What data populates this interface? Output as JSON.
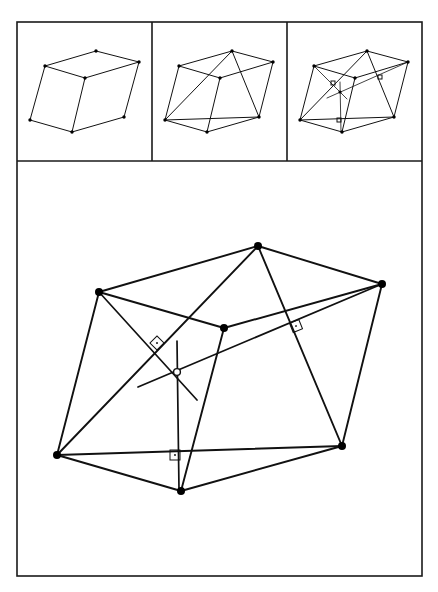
{
  "figure": {
    "colors": {
      "line": "#111111",
      "frame": "#1a1a1a",
      "background": "#ffffff"
    },
    "frame": {
      "x": 17,
      "y": 22,
      "w": 405,
      "h": 554,
      "divider_y": 161,
      "divider_x1": 152,
      "divider_x2": 287
    },
    "panels": [
      {
        "id": "panel-1-parallelepiped",
        "vertices": [
          [
            45,
            100
          ],
          [
            72,
            78
          ],
          [
            112,
            72
          ],
          [
            85,
            90
          ],
          [
            139,
            63
          ],
          [
            72,
            132
          ],
          [
            124,
            117
          ]
        ],
        "vertex_refs": {
          "A": [
            45,
            100
          ],
          "B": [
            45,
            66
          ],
          "C": [
            96,
            51
          ],
          "D": [
            85,
            78
          ],
          "E": [
            139,
            63
          ],
          "F": [
            124,
            117
          ],
          "G": [
            72,
            132
          ]
        },
        "edges": [
          [
            "B",
            "C"
          ],
          [
            "C",
            "E"
          ],
          [
            "B",
            "D"
          ],
          [
            "D",
            "E"
          ],
          [
            "B",
            "A"
          ],
          [
            "A",
            "G"
          ],
          [
            "D",
            "G"
          ],
          [
            "G",
            "F"
          ],
          [
            "F",
            "E"
          ]
        ],
        "points": {
          "A": [
            30,
            120
          ],
          "B": [
            45,
            66
          ],
          "C": [
            96,
            50
          ],
          "D": [
            86,
            78
          ],
          "E": [
            139,
            62
          ],
          "F": [
            124,
            117
          ],
          "G": [
            72,
            132
          ]
        }
      },
      {
        "id": "panel-2-tetrahedron",
        "points": {
          "A": [
            165,
            120
          ],
          "B": [
            179,
            66
          ],
          "C": [
            232,
            51
          ],
          "D": [
            220,
            78
          ],
          "E": [
            273,
            62
          ],
          "F": [
            259,
            117
          ],
          "G": [
            207,
            132
          ]
        },
        "edges": [
          [
            "B",
            "C"
          ],
          [
            "C",
            "E"
          ],
          [
            "B",
            "D"
          ],
          [
            "D",
            "E"
          ],
          [
            "B",
            "A"
          ],
          [
            "A",
            "G"
          ],
          [
            "D",
            "G"
          ],
          [
            "G",
            "F"
          ],
          [
            "F",
            "E"
          ],
          [
            "A",
            "C"
          ],
          [
            "C",
            "F"
          ],
          [
            "A",
            "F"
          ]
        ]
      },
      {
        "id": "panel-3-perpendiculars",
        "points": {
          "A": [
            300,
            120
          ],
          "B": [
            314,
            66
          ],
          "C": [
            367,
            51
          ],
          "D": [
            355,
            78
          ],
          "E": [
            408,
            62
          ],
          "F": [
            394,
            117
          ],
          "G": [
            342,
            132
          ],
          "O": [
            340,
            92
          ]
        },
        "edges": [
          [
            "B",
            "C"
          ],
          [
            "C",
            "E"
          ],
          [
            "B",
            "D"
          ],
          [
            "D",
            "E"
          ],
          [
            "B",
            "A"
          ],
          [
            "A",
            "G"
          ],
          [
            "D",
            "G"
          ],
          [
            "G",
            "F"
          ],
          [
            "F",
            "E"
          ],
          [
            "A",
            "C"
          ],
          [
            "C",
            "F"
          ],
          [
            "A",
            "F"
          ]
        ],
        "perpendiculars": [
          [
            [
              314,
              66
            ],
            [
              347,
              99
            ]
          ],
          [
            [
              408,
              62
            ],
            [
              327,
              98
            ]
          ],
          [
            [
              340,
              82
            ],
            [
              341,
              132
            ]
          ]
        ],
        "right_angle_markers": [
          [
            333,
            83
          ],
          [
            380,
            77
          ],
          [
            339,
            120
          ]
        ]
      }
    ],
    "main_panel": {
      "id": "panel-4-enlarged",
      "points": {
        "A": [
          57,
          455
        ],
        "B": [
          99,
          292
        ],
        "C": [
          258,
          246
        ],
        "D": [
          224,
          328
        ],
        "E": [
          382,
          284
        ],
        "F": [
          342,
          446
        ],
        "G": [
          181,
          491
        ]
      },
      "center_point": {
        "label": "O",
        "xy": [
          177,
          372
        ],
        "style": "open-circle"
      },
      "parallelepiped_edges": [
        [
          "B",
          "C"
        ],
        [
          "C",
          "E"
        ],
        [
          "B",
          "D"
        ],
        [
          "D",
          "E"
        ],
        [
          "A",
          "B"
        ],
        [
          "A",
          "G"
        ],
        [
          "D",
          "G"
        ],
        [
          "G",
          "F"
        ],
        [
          "F",
          "E"
        ]
      ],
      "tetrahedron_edges": [
        [
          "A",
          "C"
        ],
        [
          "C",
          "F"
        ],
        [
          "A",
          "F"
        ]
      ],
      "perpendicular_segments": [
        {
          "name": "perp-from-B",
          "from": [
            99,
            292
          ],
          "to": [
            197,
            400
          ]
        },
        {
          "name": "perp-from-E",
          "from": [
            382,
            284
          ],
          "to": [
            138,
            387
          ]
        },
        {
          "name": "perp-vertical",
          "from": [
            177,
            341
          ],
          "to": [
            179,
            490
          ]
        }
      ],
      "right_angle_markers": [
        {
          "name": "ra-marker-1",
          "x": 157,
          "y": 343,
          "rotate": 45
        },
        {
          "name": "ra-marker-2",
          "x": 296,
          "y": 326,
          "rotate": -22
        },
        {
          "name": "ra-marker-3",
          "x": 175,
          "y": 455,
          "rotate": 0
        }
      ]
    }
  }
}
